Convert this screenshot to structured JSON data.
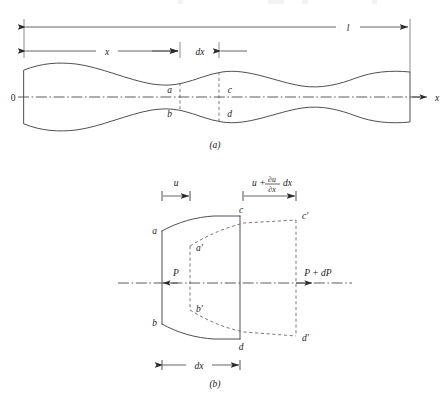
{
  "figure": {
    "panels": [
      {
        "id": "a",
        "caption": "(a)",
        "description": "Bar of varying cross-section with differential element abcd",
        "labels": {
          "origin": "0",
          "axis": "x",
          "total_length": "l",
          "distance": "x",
          "element_width": "dx",
          "corner_top_left": "a",
          "corner_bottom_left": "b",
          "corner_top_right": "c",
          "corner_bottom_right": "d"
        }
      },
      {
        "id": "b",
        "caption": "(b)",
        "description": "Enlarged element showing displacement and internal forces",
        "labels": {
          "displacement_left": "u",
          "displacement_right_lead": "u +",
          "displacement_right_num": "∂u",
          "displacement_right_den": "∂x",
          "displacement_right_tail": "dx",
          "force_left": "P",
          "force_right": "P + dP",
          "element_width": "dx",
          "corner_top_left": "a",
          "corner_bottom_left": "b",
          "corner_top_right": "c",
          "corner_bottom_right": "d",
          "corner_top_left_disp": "a′",
          "corner_bottom_left_disp": "b′",
          "corner_top_right_disp": "c′",
          "corner_bottom_right_disp": "d′"
        }
      }
    ],
    "colors": {
      "outline": "#3c3c3c",
      "dashed": "#6b6b6b",
      "centerline": "#4a4a4a",
      "text": "#1a1a1a",
      "background": "#ffffff"
    }
  }
}
